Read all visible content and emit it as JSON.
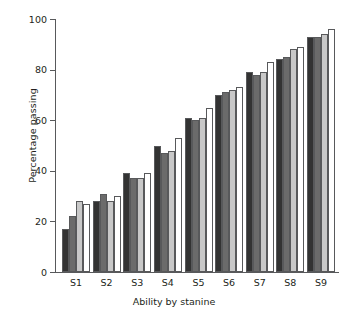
{
  "chart_data": {
    "type": "bar",
    "title": "",
    "xlabel": "Ability by stanine",
    "ylabel": "Percentage passing",
    "categories": [
      "S1",
      "S2",
      "S3",
      "S4",
      "S5",
      "S6",
      "S7",
      "S8",
      "S9"
    ],
    "ylim": [
      0,
      100
    ],
    "yticks": [
      0,
      20,
      40,
      60,
      80,
      100
    ],
    "grid": false,
    "legend": "none",
    "series": [
      {
        "name": "Series 1",
        "color": "#333333",
        "values": [
          17,
          28,
          39,
          50,
          61,
          70,
          79,
          84,
          93
        ]
      },
      {
        "name": "Series 2",
        "color": "#6b6b6b",
        "values": [
          22,
          31,
          37,
          47,
          60,
          71,
          78,
          85,
          93
        ]
      },
      {
        "name": "Series 3",
        "color": "#c8c8c8",
        "values": [
          28,
          28,
          37,
          48,
          61,
          72,
          79,
          88,
          94
        ]
      },
      {
        "name": "Series 4",
        "color": "#ffffff",
        "values": [
          27,
          30,
          39,
          53,
          65,
          73,
          83,
          89,
          96
        ]
      }
    ]
  },
  "axes": {
    "ytick_labels": [
      "100",
      "80",
      "60",
      "40",
      "20",
      "0"
    ],
    "bar_edge_color": "#58595b",
    "axis_color": "#58595b"
  },
  "caption": {
    "text": "",
    "visible_fragment": ""
  }
}
